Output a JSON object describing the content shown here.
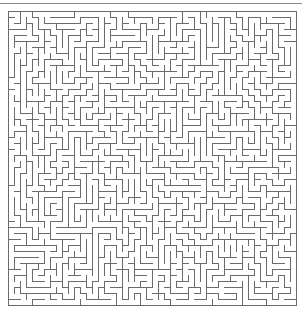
{
  "page": {
    "width": 302,
    "height": 318,
    "background": "#ffffff"
  },
  "top_rule": {
    "y": 3,
    "x": 0,
    "width": 302,
    "thickness": 1,
    "color": "#8a8a8a"
  },
  "maze": {
    "label": "rectangular perfect maze",
    "origin_x": 8,
    "origin_y": 11,
    "cols": 48,
    "rows": 49,
    "cell_px": 6,
    "wall_thickness": 1,
    "wall_color": "#6b6b6b",
    "border_color": "#6b6b6b",
    "background": "#ffffff",
    "pixel_width": 289,
    "pixel_height": 295,
    "seed": 20240617,
    "algorithm": "depth-first-search-backtracker",
    "perfect": true,
    "entrance": "none",
    "exit": "none",
    "border_closed": true
  }
}
